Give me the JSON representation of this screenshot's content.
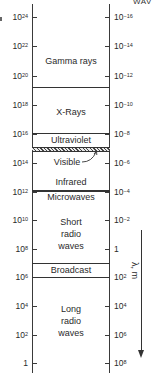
{
  "header": {
    "right_partial": "WAV"
  },
  "axis_left": {
    "quantity": "frequency (Hz)",
    "ticks": [
      {
        "base": "10",
        "exp": "24",
        "y": 17
      },
      {
        "base": "10",
        "exp": "22",
        "y": 46
      },
      {
        "base": "10",
        "exp": "20",
        "y": 76
      },
      {
        "base": "10",
        "exp": "18",
        "y": 105
      },
      {
        "base": "10",
        "exp": "16",
        "y": 134
      },
      {
        "base": "10",
        "exp": "14",
        "y": 163
      },
      {
        "base": "10",
        "exp": "12",
        "y": 192
      },
      {
        "base": "10",
        "exp": "10",
        "y": 220
      },
      {
        "base": "10",
        "exp": "8",
        "y": 249
      },
      {
        "base": "10",
        "exp": "6",
        "y": 277
      },
      {
        "base": "10",
        "exp": "4",
        "y": 306
      },
      {
        "base": "10",
        "exp": "2",
        "y": 335
      },
      {
        "base": "1",
        "exp": "",
        "y": 363
      }
    ]
  },
  "axis_right": {
    "quantity": "wavelength (m)",
    "ticks": [
      {
        "base": "10",
        "exp": "−16",
        "y": 17
      },
      {
        "base": "10",
        "exp": "−14",
        "y": 46
      },
      {
        "base": "10",
        "exp": "−12",
        "y": 76
      },
      {
        "base": "10",
        "exp": "−10",
        "y": 105
      },
      {
        "base": "10",
        "exp": "−8",
        "y": 134
      },
      {
        "base": "10",
        "exp": "−6",
        "y": 163
      },
      {
        "base": "10",
        "exp": "−4",
        "y": 192
      },
      {
        "base": "10",
        "exp": "−2",
        "y": 220
      },
      {
        "base": "1",
        "exp": "",
        "y": 249
      },
      {
        "base": "10",
        "exp": "2",
        "y": 277
      },
      {
        "base": "10",
        "exp": "4",
        "y": 306
      },
      {
        "base": "10",
        "exp": "6",
        "y": 335
      },
      {
        "base": "10",
        "exp": "8",
        "y": 363
      }
    ]
  },
  "bands": {
    "gamma": "Gamma rays",
    "xray": "X-Rays",
    "uv": "Ultraviolet",
    "visible": "Visible",
    "ir": "Infrared",
    "micro": "Microwaves",
    "short1": "Short",
    "short2": "radio",
    "short3": "waves",
    "broadcast": "Broadcast",
    "long1": "Long",
    "long2": "radio",
    "long3": "waves"
  },
  "arrow": {
    "label": "λ, m"
  },
  "colors": {
    "line": "#333333",
    "text": "#2a2a2a",
    "background": "#ffffff"
  }
}
